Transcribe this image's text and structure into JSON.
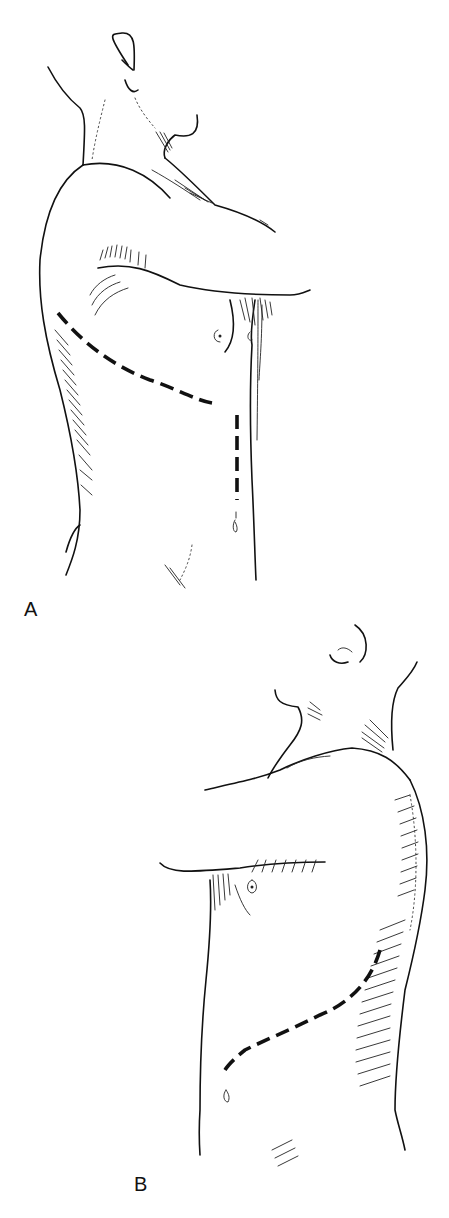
{
  "figure": {
    "panels": [
      {
        "id": "A",
        "label": "A",
        "view": "left lateral view, arm raised across chest",
        "incisions": [
          "curved lateral thoracic incision",
          "vertical midline abdominal incision"
        ]
      },
      {
        "id": "B",
        "label": "B",
        "view": "right anterolateral view, arm raised",
        "incisions": [
          "oblique thoracoabdominal incision"
        ]
      }
    ],
    "colors": {
      "line": "#111111",
      "background": "#ffffff"
    }
  }
}
